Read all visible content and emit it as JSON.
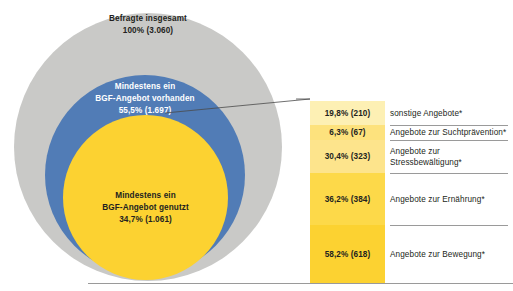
{
  "chart_data": {
    "type": "venn-and-bar",
    "title": "",
    "venn": {
      "sets": [
        {
          "name": "Befragte insgesamt",
          "label_line1": "Befragte insgesamt",
          "label_line2": "100% (3.060)",
          "percent": 100,
          "count": 3060,
          "color": "#c9c9c7",
          "text_color": "#231f20"
        },
        {
          "name": "Mindestens ein BGF-Angebot vorhanden",
          "label_line1": "Mindestens ein",
          "label_line2": "BGF-Angebot vorhanden",
          "label_line3": "55,5% (1.697)",
          "percent": 55.5,
          "count": 1697,
          "color": "#517cb6",
          "text_color": "#ffffff"
        },
        {
          "name": "Mindestens ein BGF-Angebot genutzt",
          "label_line1": "Mindestens ein",
          "label_line2": "BGF-Angebot genutzt",
          "label_line3": "34,7% (1.061)",
          "percent": 34.7,
          "count": 1061,
          "color": "#fcd231",
          "text_color": "#231f20"
        }
      ]
    },
    "bar": {
      "orientation": "vertical-stacked",
      "segments": [
        {
          "value_label": "19,8% (210)",
          "percent": 19.8,
          "count": 210,
          "category_line1": "sonstige Angebote*",
          "category_line2": "",
          "color": "#fdf0b4",
          "height_px": 24
        },
        {
          "value_label": "6,3% (67)",
          "percent": 6.3,
          "count": 67,
          "category_line1": "Angebote zur Suchtprävention*",
          "category_line2": "",
          "color": "#fde27d",
          "height_px": 15
        },
        {
          "value_label": "30,4% (323)",
          "percent": 30.4,
          "count": 323,
          "category_line1": "Angebote zur",
          "category_line2": "Stressbewältigung*",
          "color": "#fde48c",
          "height_px": 33
        },
        {
          "value_label": "36,2% (384)",
          "percent": 36.2,
          "count": 384,
          "category_line1": "Angebote zur Ernährung*",
          "category_line2": "",
          "color": "#fdd949",
          "height_px": 52
        },
        {
          "value_label": "58,2% (618)",
          "percent": 58.2,
          "count": 618,
          "category_line1": "Angebote zur Bewegung*",
          "category_line2": "",
          "color": "#fcd231",
          "height_px": 58
        }
      ]
    }
  },
  "venn": {
    "outer": {
      "line1": "Befragte insgesamt",
      "line2": "100% (3.060)"
    },
    "middle": {
      "line1": "Mindestens ein",
      "line2": "BGF-Angebot vorhanden",
      "line3": "55,5% (1.697)"
    },
    "inner": {
      "line1": "Mindestens ein",
      "line2": "BGF-Angebot genutzt",
      "line3": "34,7% (1.061)"
    }
  },
  "bar_segments": [
    {
      "value": "19,8% (210)"
    },
    {
      "value": "6,3% (67)"
    },
    {
      "value": "30,4% (323)"
    },
    {
      "value": "36,2% (384)"
    },
    {
      "value": "58,2% (618)"
    }
  ],
  "bar_categories": [
    {
      "line1": "sonstige Angebote*",
      "line2": ""
    },
    {
      "line1": "Angebote zur Suchtprävention*",
      "line2": ""
    },
    {
      "line1": "Angebote zur",
      "line2": "Stressbewältigung*"
    },
    {
      "line1": "Angebote zur Ernährung*",
      "line2": ""
    },
    {
      "line1": "Angebote zur Bewegung*",
      "line2": ""
    }
  ],
  "colors": {
    "gray": "#c9c9c7",
    "blue": "#517cb6",
    "yellow": "#fcd231",
    "rule": "#9a9a9a",
    "text": "#231f20"
  }
}
